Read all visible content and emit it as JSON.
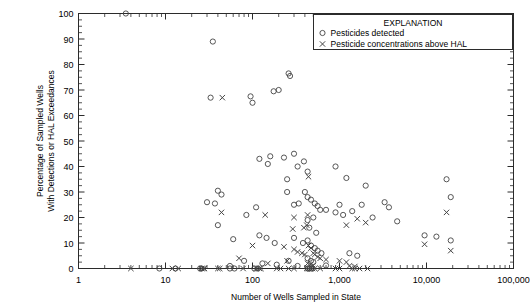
{
  "chart_data": {
    "type": "scatter",
    "title": "",
    "xlabel": "Number of Wells Sampled in State",
    "ylabel_line1": "Percentage of Sampled Wells",
    "ylabel_line2": "With Detections or HAL Exceedances",
    "xscale": "log",
    "xlim": [
      1,
      100000
    ],
    "ylim": [
      0,
      100
    ],
    "xticks": [
      1,
      10,
      100,
      1000,
      10000,
      100000
    ],
    "xtick_labels": [
      "1",
      "10",
      "100",
      "1,000",
      "10,000",
      "100,000"
    ],
    "yticks": [
      0,
      10,
      20,
      30,
      40,
      50,
      60,
      70,
      80,
      90,
      100
    ],
    "ytick_labels": [
      "0",
      "10",
      "20",
      "30",
      "40",
      "50",
      "60",
      "70",
      "80",
      "90",
      "100"
    ],
    "grid": false,
    "legend": {
      "position": "top-right",
      "title": "EXPLANATION",
      "entries": [
        {
          "marker": "circle",
          "label": "Pesticides detected"
        },
        {
          "marker": "cross",
          "label": "Pesticide concentrations above HAL"
        }
      ]
    },
    "series": [
      {
        "name": "Pesticides detected",
        "marker": "circle",
        "color": "#444444",
        "points": [
          [
            3.5,
            100
          ],
          [
            35,
            89
          ],
          [
            33,
            67
          ],
          [
            95,
            67.5
          ],
          [
            100,
            65
          ],
          [
            175,
            69.5
          ],
          [
            200,
            70
          ],
          [
            260,
            76.5
          ],
          [
            270,
            75.5
          ],
          [
            120,
            43
          ],
          [
            160,
            44
          ],
          [
            150,
            41
          ],
          [
            230,
            43.5
          ],
          [
            300,
            45
          ],
          [
            330,
            40
          ],
          [
            390,
            42
          ],
          [
            430,
            38
          ],
          [
            250,
            35
          ],
          [
            900,
            40
          ],
          [
            1200,
            35.5
          ],
          [
            2000,
            32.5
          ],
          [
            17000,
            35
          ],
          [
            19000,
            28
          ],
          [
            30,
            26
          ],
          [
            37,
            25.5
          ],
          [
            40,
            30.5
          ],
          [
            44,
            29
          ],
          [
            40,
            17
          ],
          [
            60,
            11.5
          ],
          [
            85,
            21
          ],
          [
            110,
            24
          ],
          [
            250,
            30
          ],
          [
            300,
            25
          ],
          [
            340,
            25.5
          ],
          [
            400,
            30
          ],
          [
            430,
            28
          ],
          [
            470,
            27
          ],
          [
            520,
            25.5
          ],
          [
            560,
            24.5
          ],
          [
            600,
            23
          ],
          [
            430,
            19
          ],
          [
            450,
            16
          ],
          [
            500,
            20
          ],
          [
            540,
            14
          ],
          [
            700,
            23
          ],
          [
            900,
            22
          ],
          [
            1000,
            25
          ],
          [
            1100,
            21
          ],
          [
            1400,
            22.5
          ],
          [
            1800,
            25
          ],
          [
            2400,
            20
          ],
          [
            3300,
            26
          ],
          [
            3700,
            24
          ],
          [
            4600,
            18.5
          ],
          [
            9500,
            13
          ],
          [
            13000,
            12.5
          ],
          [
            19000,
            11
          ],
          [
            120,
            13
          ],
          [
            145,
            12
          ],
          [
            180,
            10
          ],
          [
            300,
            12
          ],
          [
            380,
            10
          ],
          [
            430,
            11
          ],
          [
            470,
            9
          ],
          [
            520,
            8
          ],
          [
            560,
            7
          ],
          [
            620,
            6
          ],
          [
            80,
            3
          ],
          [
            130,
            2
          ],
          [
            260,
            3
          ],
          [
            430,
            4
          ],
          [
            470,
            3
          ],
          [
            500,
            2.5
          ],
          [
            1300,
            6
          ],
          [
            1600,
            5
          ],
          [
            55,
            1
          ],
          [
            190,
            1.5
          ],
          [
            330,
            1
          ],
          [
            700,
            1.2
          ],
          [
            8.5,
            0
          ],
          [
            13,
            0
          ],
          [
            25,
            0
          ],
          [
            26,
            0
          ],
          [
            55,
            0
          ],
          [
            62,
            0
          ],
          [
            105,
            0
          ],
          [
            115,
            0
          ],
          [
            430,
            0
          ],
          [
            450,
            0
          ],
          [
            480,
            0
          ]
        ]
      },
      {
        "name": "Pesticide concentrations above HAL",
        "marker": "cross",
        "color": "#444444",
        "points": [
          [
            45,
            67
          ],
          [
            440,
            36
          ],
          [
            17000,
            22
          ],
          [
            140,
            21
          ],
          [
            300,
            20
          ],
          [
            430,
            21
          ],
          [
            44,
            22
          ],
          [
            290,
            15.5
          ],
          [
            390,
            16
          ],
          [
            420,
            17
          ],
          [
            1200,
            17
          ],
          [
            1600,
            19.5
          ],
          [
            2000,
            18
          ],
          [
            9500,
            9.5
          ],
          [
            19000,
            7
          ],
          [
            100,
            9
          ],
          [
            230,
            8.5
          ],
          [
            300,
            7.5
          ],
          [
            330,
            6.5
          ],
          [
            370,
            6
          ],
          [
            400,
            5.5
          ],
          [
            440,
            9
          ],
          [
            470,
            8
          ],
          [
            500,
            6
          ],
          [
            520,
            5.5
          ],
          [
            560,
            4.5
          ],
          [
            600,
            4
          ],
          [
            700,
            3.5
          ],
          [
            1000,
            3
          ],
          [
            1200,
            2.5
          ],
          [
            70,
            4
          ],
          [
            150,
            2
          ],
          [
            250,
            3
          ],
          [
            430,
            2
          ],
          [
            460,
            1.5
          ],
          [
            490,
            1
          ],
          [
            1300,
            1
          ],
          [
            1500,
            0.8
          ],
          [
            4,
            0
          ],
          [
            12,
            0
          ],
          [
            14,
            0
          ],
          [
            26,
            0
          ],
          [
            27,
            0
          ],
          [
            28,
            0
          ],
          [
            40,
            0
          ],
          [
            42,
            0
          ],
          [
            78,
            0
          ],
          [
            110,
            0
          ],
          [
            120,
            0
          ],
          [
            125,
            0
          ],
          [
            190,
            0
          ],
          [
            210,
            0
          ],
          [
            260,
            0
          ],
          [
            300,
            0
          ],
          [
            420,
            0
          ],
          [
            440,
            0
          ],
          [
            460,
            0
          ],
          [
            470,
            0
          ],
          [
            490,
            0
          ],
          [
            520,
            0
          ],
          [
            600,
            0
          ],
          [
            900,
            0
          ],
          [
            1000,
            0
          ],
          [
            1400,
            0
          ],
          [
            1500,
            0
          ],
          [
            1700,
            0
          ],
          [
            2100,
            0
          ]
        ]
      }
    ]
  }
}
